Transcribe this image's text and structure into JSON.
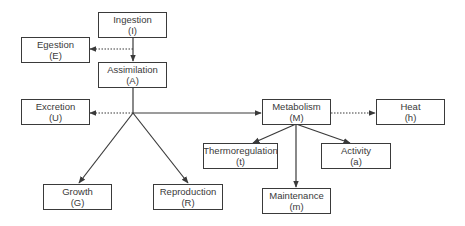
{
  "diagram": {
    "nodes": {
      "ingestion": {
        "label": "Ingestion",
        "symbol": "(I)"
      },
      "egestion": {
        "label": "Egestion",
        "symbol": "(E)"
      },
      "assimilation": {
        "label": "Assimilation",
        "symbol": "(A)"
      },
      "excretion": {
        "label": "Excretion",
        "symbol": "(U)"
      },
      "metabolism": {
        "label": "Metabolism",
        "symbol": "(M)"
      },
      "heat": {
        "label": "Heat",
        "symbol": "(h)"
      },
      "thermoregulation": {
        "label": "Thermoregulation",
        "symbol": "(t)"
      },
      "activity": {
        "label": "Activity",
        "symbol": "(a)"
      },
      "maintenance": {
        "label": "Maintenance",
        "symbol": "(m)"
      },
      "growth": {
        "label": "Growth",
        "symbol": "(G)"
      },
      "reproduction": {
        "label": "Reproduction",
        "symbol": "(R)"
      }
    },
    "edges": [
      {
        "from": "ingestion",
        "to": "assimilation",
        "style": "solid"
      },
      {
        "from": "ingestion",
        "to": "egestion",
        "style": "dotted"
      },
      {
        "from": "assimilation",
        "to": "excretion",
        "style": "dotted"
      },
      {
        "from": "assimilation",
        "to": "metabolism",
        "style": "solid"
      },
      {
        "from": "assimilation",
        "to": "growth",
        "style": "solid"
      },
      {
        "from": "assimilation",
        "to": "reproduction",
        "style": "solid"
      },
      {
        "from": "metabolism",
        "to": "heat",
        "style": "dotted"
      },
      {
        "from": "metabolism",
        "to": "thermoregulation",
        "style": "solid"
      },
      {
        "from": "metabolism",
        "to": "activity",
        "style": "solid"
      },
      {
        "from": "metabolism",
        "to": "maintenance",
        "style": "solid"
      }
    ],
    "colors": {
      "line": "#3a3a3a",
      "text": "#3a3a3a",
      "background": "#ffffff"
    }
  }
}
